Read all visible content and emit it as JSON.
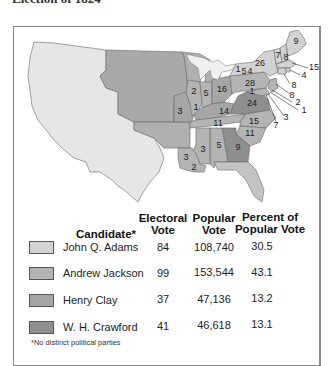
{
  "title": "Election of 1824",
  "colors": {
    "adams": "#d3d3d3",
    "jackson": "#b4b4b4",
    "clay": "#a6a6a6",
    "crawford": "#8f8f8f",
    "territory": "#e8e8e8",
    "unorganized": "#a0a0a0",
    "lakes": "#eeeeee",
    "border": "#666666"
  },
  "map": {
    "state_labels": [
      {
        "state": "Maine",
        "value": "9"
      },
      {
        "state": "New Hampshire",
        "value": "8"
      },
      {
        "state": "Vermont",
        "value": "7"
      },
      {
        "state": "Massachusetts",
        "value": "15"
      },
      {
        "state": "Rhode Island",
        "value": "4"
      },
      {
        "state": "Connecticut",
        "value": "8"
      },
      {
        "state": "New York (Adams)",
        "value": "26"
      },
      {
        "state": "New York (Clay)",
        "value": "4"
      },
      {
        "state": "New York (Jackson)",
        "value": "1"
      },
      {
        "state": "New York (Crawford)",
        "value": "5"
      },
      {
        "state": "New Jersey",
        "value": "8"
      },
      {
        "state": "Pennsylvania",
        "value": "28"
      },
      {
        "state": "Delaware (Crawford)",
        "value": "2"
      },
      {
        "state": "Delaware (Adams)",
        "value": "1"
      },
      {
        "state": "Maryland (Jackson)",
        "value": "7"
      },
      {
        "state": "Maryland (Adams)",
        "value": "3"
      },
      {
        "state": "Maryland (Crawford)",
        "value": "1"
      },
      {
        "state": "Virginia",
        "value": "24"
      },
      {
        "state": "North Carolina",
        "value": "15"
      },
      {
        "state": "South Carolina",
        "value": "11"
      },
      {
        "state": "Georgia",
        "value": "9"
      },
      {
        "state": "Alabama",
        "value": "5"
      },
      {
        "state": "Mississippi",
        "value": "3"
      },
      {
        "state": "Louisiana (Jackson)",
        "value": "3"
      },
      {
        "state": "Louisiana (Adams)",
        "value": "2"
      },
      {
        "state": "Tennessee",
        "value": "11"
      },
      {
        "state": "Kentucky",
        "value": "14"
      },
      {
        "state": "Ohio",
        "value": "16"
      },
      {
        "state": "Indiana",
        "value": "5"
      },
      {
        "state": "Illinois (Jackson)",
        "value": "2"
      },
      {
        "state": "Illinois (Adams)",
        "value": "1"
      },
      {
        "state": "Missouri",
        "value": "3"
      }
    ]
  },
  "table": {
    "headers": {
      "candidate": "Candidate*",
      "electoral_1": "Electoral",
      "electoral_2": "Vote",
      "popular_1": "Popular",
      "popular_2": "Vote",
      "percent_1": "Percent of",
      "percent_2": "Popular Vote"
    },
    "rows": [
      {
        "candidate": "John Q. Adams",
        "electoral": "84",
        "popular": "108,740",
        "percent": "30.5"
      },
      {
        "candidate": "Andrew Jackson",
        "electoral": "99",
        "popular": "153,544",
        "percent": "43.1"
      },
      {
        "candidate": "Henry Clay",
        "electoral": "37",
        "popular": "47,136",
        "percent": "13.2"
      },
      {
        "candidate": "W. H. Crawford",
        "electoral": "41",
        "popular": "46,618",
        "percent": "13.1"
      }
    ],
    "footnote": "*No distinct political parties"
  }
}
